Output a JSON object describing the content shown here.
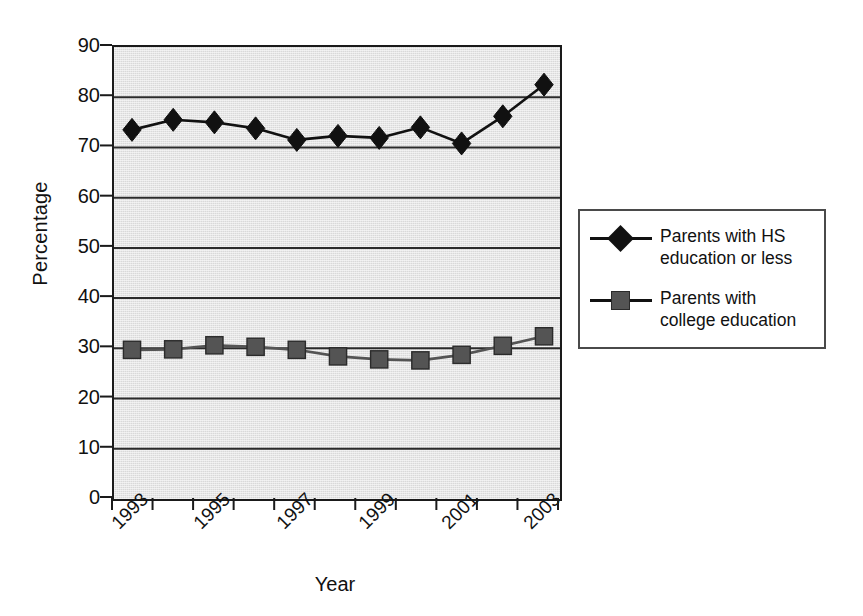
{
  "chart_data": {
    "type": "line",
    "title": "",
    "xlabel": "Year",
    "ylabel": "Percentage",
    "ylim": [
      0,
      90
    ],
    "ytick_step": 10,
    "yticks": [
      90,
      80,
      70,
      60,
      50,
      40,
      30,
      20,
      10,
      0
    ],
    "grid": true,
    "grid_axis": "y",
    "legend_position": "right",
    "x": [
      1993,
      1994,
      1995,
      1996,
      1997,
      1998,
      1999,
      2000,
      2001,
      2002,
      2003
    ],
    "categories": [
      "1993",
      "1994",
      "1995",
      "1996",
      "1997",
      "1998",
      "1999",
      "2000",
      "2001",
      "2002",
      "2003"
    ],
    "xtick_labels": [
      "1993",
      "1995",
      "1997",
      "1999",
      "2001",
      "2003"
    ],
    "xtick_label_years": [
      1993,
      1995,
      1997,
      1999,
      2001,
      2003
    ],
    "series": [
      {
        "name": "Parents with HS education or less",
        "marker": "diamond",
        "color": "#111111",
        "values": [
          73.5,
          75.5,
          75.0,
          73.8,
          71.5,
          72.3,
          71.9,
          74.0,
          70.8,
          76.2,
          82.5
        ]
      },
      {
        "name": "Parents with college education",
        "marker": "square",
        "color": "#545454",
        "values": [
          29.7,
          29.8,
          30.6,
          30.3,
          29.7,
          28.4,
          27.8,
          27.6,
          28.7,
          30.5,
          32.4
        ]
      }
    ]
  },
  "axes": {
    "y_title": "Percentage",
    "x_title": "Year",
    "y_tick_labels": [
      "90",
      "80",
      "70",
      "60",
      "50",
      "40",
      "30",
      "20",
      "10",
      "0"
    ],
    "x_tick_labels": [
      "1993",
      "1995",
      "1997",
      "1999",
      "2001",
      "2003"
    ]
  },
  "legend": {
    "entries": [
      {
        "key": "hs",
        "marker": "diamond",
        "line1": "Parents with HS",
        "line2": "education or less"
      },
      {
        "key": "college",
        "marker": "square",
        "line1": "Parents with",
        "line2": "college education"
      }
    ]
  },
  "colors": {
    "plot_background": "#d9d9d9",
    "axis": "#1a1a1a",
    "gridline": "#2b2b2b",
    "series_hs": "#111111",
    "series_college": "#545454",
    "legend_border": "#4a4a4a",
    "page_background": "#ffffff"
  }
}
